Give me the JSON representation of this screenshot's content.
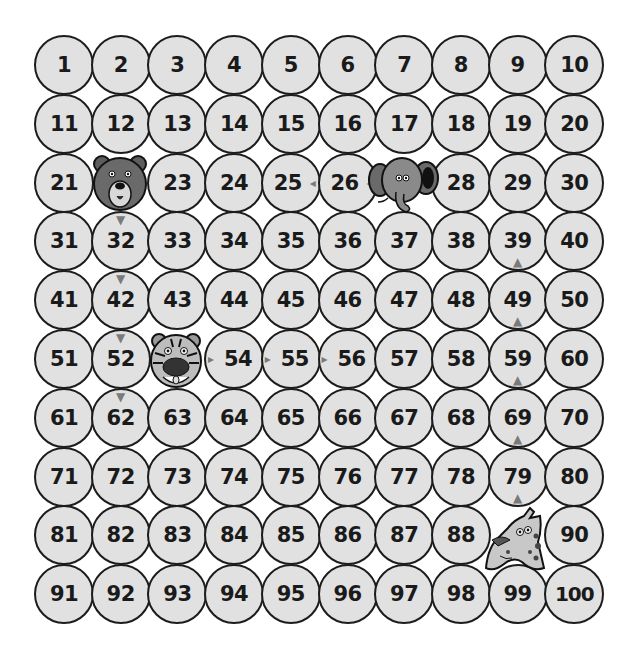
{
  "board": {
    "rows": 10,
    "cols": 10,
    "colors": {
      "cell_fill": "#e1e1e1",
      "cell_border": "#1c1c1c",
      "number": "#1a1a1a",
      "arrow": "#7a7a7a",
      "animal_fur": "#6e6e6e"
    },
    "cells": [
      "1",
      "2",
      "3",
      "4",
      "5",
      "6",
      "7",
      "8",
      "9",
      "10",
      "11",
      "12",
      "13",
      "14",
      "15",
      "16",
      "17",
      "18",
      "19",
      "20",
      "21",
      "",
      "23",
      "24",
      "25",
      "26",
      "",
      "28",
      "29",
      "30",
      "31",
      "32",
      "33",
      "34",
      "35",
      "36",
      "37",
      "38",
      "39",
      "40",
      "41",
      "42",
      "43",
      "44",
      "45",
      "46",
      "47",
      "48",
      "49",
      "50",
      "51",
      "52",
      "",
      "54",
      "55",
      "56",
      "57",
      "58",
      "59",
      "60",
      "61",
      "62",
      "63",
      "64",
      "65",
      "66",
      "67",
      "68",
      "69",
      "70",
      "71",
      "72",
      "73",
      "74",
      "75",
      "76",
      "77",
      "78",
      "79",
      "80",
      "81",
      "82",
      "83",
      "84",
      "85",
      "86",
      "87",
      "88",
      "",
      "90",
      "91",
      "92",
      "93",
      "94",
      "95",
      "96",
      "97",
      "98",
      "99",
      "100"
    ],
    "animals": [
      {
        "name": "bear",
        "icon": "bear-icon",
        "cell": 22,
        "direction": "down",
        "path": [
          32,
          42,
          52,
          62
        ]
      },
      {
        "name": "elephant",
        "icon": "elephant-icon",
        "cell": 27,
        "direction": "left",
        "path": [
          26,
          25
        ]
      },
      {
        "name": "tiger",
        "icon": "tiger-icon",
        "cell": 53,
        "direction": "right",
        "path": [
          54,
          55,
          56
        ]
      },
      {
        "name": "giraffe",
        "icon": "giraffe-icon",
        "cell": 89,
        "direction": "up",
        "path": [
          79,
          69,
          59,
          49,
          39
        ]
      }
    ],
    "arrows": [
      {
        "cell": 32,
        "dir": "down",
        "glyph": "▼"
      },
      {
        "cell": 42,
        "dir": "down",
        "glyph": "▼"
      },
      {
        "cell": 52,
        "dir": "down",
        "glyph": "▼"
      },
      {
        "cell": 62,
        "dir": "down",
        "glyph": "▼"
      },
      {
        "cell": 26,
        "dir": "left",
        "glyph": "◂"
      },
      {
        "cell": 25,
        "dir": "left",
        "glyph": "◂"
      },
      {
        "cell": 54,
        "dir": "right",
        "glyph": "▸"
      },
      {
        "cell": 55,
        "dir": "right",
        "glyph": "▸"
      },
      {
        "cell": 56,
        "dir": "right",
        "glyph": "▸"
      },
      {
        "cell": 79,
        "dir": "up",
        "glyph": "▲"
      },
      {
        "cell": 69,
        "dir": "up",
        "glyph": "▲"
      },
      {
        "cell": 59,
        "dir": "up",
        "glyph": "▲"
      },
      {
        "cell": 49,
        "dir": "up",
        "glyph": "▲"
      },
      {
        "cell": 39,
        "dir": "up",
        "glyph": "▲"
      }
    ]
  }
}
